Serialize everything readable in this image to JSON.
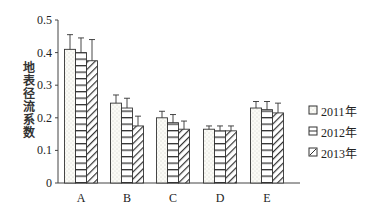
{
  "chart_data": {
    "type": "bar",
    "title": "",
    "xlabel": "",
    "ylabel": "地表径流系数",
    "ylim": [
      0,
      0.5
    ],
    "yticks": [
      "0",
      "0.1",
      "0.2",
      "0.3",
      "0.4",
      "0.5"
    ],
    "categories": [
      "A",
      "B",
      "C",
      "D",
      "E"
    ],
    "series": [
      {
        "name": "2011年",
        "pattern": "dots",
        "values": [
          0.41,
          0.245,
          0.2,
          0.165,
          0.23
        ],
        "error_upper": [
          0.455,
          0.27,
          0.22,
          0.175,
          0.25
        ]
      },
      {
        "name": "2012年",
        "pattern": "horizontal-lines",
        "values": [
          0.4,
          0.23,
          0.185,
          0.16,
          0.225
        ],
        "error_upper": [
          0.445,
          0.26,
          0.21,
          0.175,
          0.25
        ]
      },
      {
        "name": "2013年",
        "pattern": "diagonal-hatch",
        "values": [
          0.375,
          0.175,
          0.165,
          0.16,
          0.215
        ],
        "error_upper": [
          0.44,
          0.205,
          0.19,
          0.175,
          0.245
        ]
      }
    ],
    "grid": false,
    "legend_position": "right",
    "error_bars": true
  },
  "legend": {
    "items": [
      "2011年",
      "2012年",
      "2013年"
    ]
  },
  "axis": {
    "ylabel": "地表径流系数"
  }
}
